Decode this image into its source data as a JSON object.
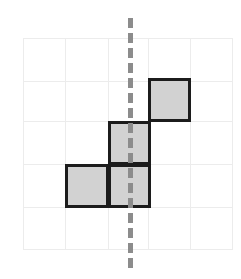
{
  "figure": {
    "canvas": {
      "width": 241,
      "height": 279,
      "background": "#ffffff"
    }
  },
  "grid": {
    "name": "square-grid",
    "columns": 5,
    "rows": 5,
    "cell_size": 42,
    "origin_x": 23,
    "origin_y": 38,
    "width": 210,
    "height": 212,
    "line_color": "#ececec",
    "line_width": 1,
    "x_lines": [
      0,
      42,
      85,
      125,
      167,
      210
    ],
    "y_lines": [
      0,
      43,
      83,
      126,
      169,
      212
    ]
  },
  "shape": {
    "name": "shaded-polyomino",
    "fill_color": "#d2d2d2",
    "border_color": "#1c1c1c",
    "border_width": 3,
    "cell_count": 4,
    "cells": [
      {
        "label": "cell-bottom-left",
        "col": 1,
        "row": 3,
        "x": 65,
        "y": 164,
        "w": 44,
        "h": 44
      },
      {
        "label": "cell-bottom-mid",
        "col": 2,
        "row": 3,
        "x": 108,
        "y": 164,
        "w": 43,
        "h": 44
      },
      {
        "label": "cell-middle",
        "col": 2,
        "row": 2,
        "x": 108,
        "y": 121,
        "w": 43,
        "h": 44
      },
      {
        "label": "cell-top-right",
        "col": 3,
        "row": 1,
        "x": 148,
        "y": 78,
        "w": 43,
        "h": 44
      }
    ]
  },
  "symmetry_line": {
    "name": "vertical-dashed-line",
    "orientation": "vertical",
    "x": 130,
    "y_start": 18,
    "y_end": 268,
    "length": 250,
    "color": "#8c8c8c",
    "stroke_width": 5,
    "dash": "dashed"
  }
}
